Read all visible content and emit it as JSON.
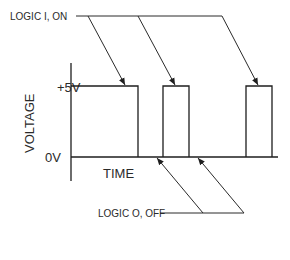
{
  "diagram": {
    "labels": {
      "logic_on": "LOGIC I, ON",
      "logic_off": "LOGIC O, OFF",
      "y_axis": "VOLTAGE",
      "x_axis": "TIME",
      "high_level": "+5V",
      "low_level": "0V"
    },
    "signal": {
      "high_voltage": "+5V",
      "low_voltage": "0V",
      "pulses": [
        {
          "start": 0,
          "end": 67
        },
        {
          "start": 92,
          "end": 118
        },
        {
          "start": 175,
          "end": 201
        }
      ]
    },
    "colors": {
      "ink": "#1e1e1e",
      "background": "#ffffff"
    }
  }
}
